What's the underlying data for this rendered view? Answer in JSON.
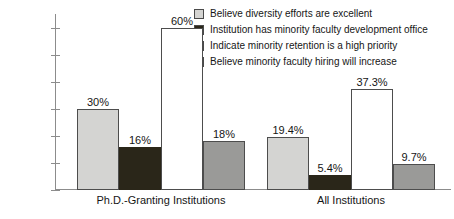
{
  "chart_data": {
    "type": "bar",
    "title": "",
    "subtitle": "",
    "xlabel": "",
    "ylabel": "",
    "categories": [
      "Ph.D.-Granting Institutions",
      "All Institutions"
    ],
    "ylim": [
      0,
      65
    ],
    "ytick_values": [
      0,
      10,
      20,
      30,
      40,
      50,
      60
    ],
    "ytick_labels": [
      "0%",
      "10%",
      "20%",
      "30%",
      "40%",
      "50%",
      "60%"
    ],
    "grid": false,
    "legend_position": "top-right",
    "series": [
      {
        "name": "Believe diversity efforts are excellent",
        "color": "#d4d4d2",
        "values": [
          30,
          19.4
        ],
        "labels": [
          "30%",
          "19.4%"
        ]
      },
      {
        "name": "Institution has minority faculty development office",
        "color": "#2a2619",
        "values": [
          16,
          5.4
        ],
        "labels": [
          "16%",
          "5.4%"
        ]
      },
      {
        "name": "Indicate minority retention is a high priority",
        "color": "#ffffff",
        "values": [
          60,
          37.3
        ],
        "labels": [
          "60%",
          "37.3%"
        ]
      },
      {
        "name": "Believe minority faculty hiring will increase",
        "color": "#9a9a98",
        "values": [
          18,
          9.7
        ],
        "labels": [
          "18%",
          "9.7%"
        ]
      }
    ]
  }
}
